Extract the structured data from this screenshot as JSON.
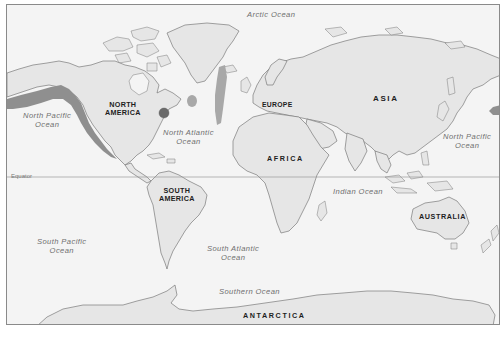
{
  "map": {
    "type": "world-political-outline",
    "projection": "Mercator",
    "style": "grayscale outline map with shaded highlight regions",
    "colors": {
      "ocean": "#f4f4f4",
      "land": "#e6e6e6",
      "coastline": "#7a7a7a",
      "highlight": "#8f8f8f",
      "highlight_dark": "#6a6a6a",
      "highlight_light": "#a8a8a8",
      "frame": "#8a8a8a"
    },
    "continents": {
      "north_america": [
        "NORTH",
        "AMERICA"
      ],
      "south_america": [
        "SOUTH",
        "AMERICA"
      ],
      "europe": "EUROPE",
      "africa": "AFRICA",
      "asia": "ASIA",
      "australia": "AUSTRALIA",
      "antarctica": "ANTARCTICA"
    },
    "oceans": {
      "arctic": "Arctic Ocean",
      "north_pacific_west": [
        "North Pacific",
        "Ocean"
      ],
      "north_pacific_east": [
        "North Pacific",
        "Ocean"
      ],
      "north_atlantic": [
        "North Atlantic",
        "Ocean"
      ],
      "south_pacific": [
        "South Pacific",
        "Ocean"
      ],
      "south_atlantic": [
        "South Atlantic",
        "Ocean"
      ],
      "indian": "Indian Ocean",
      "southern": "Southern Ocean"
    },
    "reference_lines": {
      "equator": "Equator"
    },
    "highlighted_regions": [
      "Pacific coast of North America (Alaska to Mexico)",
      "Eastern US coast spot (dark circle)",
      "Mid-Atlantic oval spot",
      "Mid-Atlantic Ridge strip near Iceland",
      "Eastern edge of Asia Pacific strip (Kamchatka area)"
    ]
  }
}
